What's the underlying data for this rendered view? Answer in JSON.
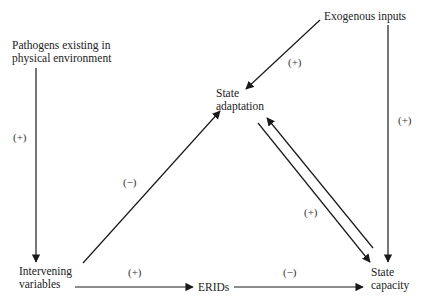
{
  "diagram": {
    "nodes": [
      {
        "id": "pathogens",
        "line1": "Pathogens existing in",
        "line2": "physical environment"
      },
      {
        "id": "exogenous",
        "line1": "Exogenous inputs",
        "line2": ""
      },
      {
        "id": "state_adaptation",
        "line1": "State",
        "line2": "adaptation"
      },
      {
        "id": "intervening",
        "line1": "Intervening",
        "line2": "variables"
      },
      {
        "id": "erids",
        "line1": "ERIDs",
        "line2": ""
      },
      {
        "id": "state_capacity",
        "line1": "State",
        "line2": "capacity"
      }
    ],
    "edges": [
      {
        "from": "exogenous",
        "to": "state_adaptation",
        "sign": "(+)"
      },
      {
        "from": "exogenous",
        "to": "state_capacity",
        "sign": "(+)"
      },
      {
        "from": "pathogens",
        "to": "intervening",
        "sign": "(+)"
      },
      {
        "from": "intervening",
        "to": "state_adaptation",
        "sign": "(−)"
      },
      {
        "from": "state_adaptation",
        "to": "state_capacity",
        "sign": "(+)"
      },
      {
        "from": "state_capacity",
        "to": "state_adaptation",
        "sign": ""
      },
      {
        "from": "intervening",
        "to": "erids",
        "sign": "(+)"
      },
      {
        "from": "erids",
        "to": "state_capacity",
        "sign": "(−)"
      }
    ],
    "line_color": "#1a1a1a"
  }
}
